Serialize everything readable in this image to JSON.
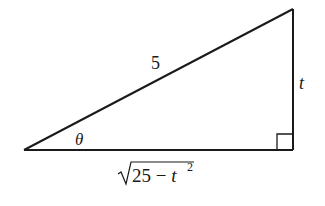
{
  "diagram": {
    "type": "right-triangle",
    "vertices": {
      "left": {
        "x": 24,
        "y": 150
      },
      "bottom_right": {
        "x": 293,
        "y": 150
      },
      "top_right": {
        "x": 293,
        "y": 9
      }
    },
    "stroke_color": "#1a1a1a",
    "labels": {
      "hypotenuse": "5",
      "opposite": "t",
      "angle": "θ",
      "adjacent_radicand": "25 − t",
      "adjacent_exponent": "2"
    },
    "right_angle_marker": true
  }
}
